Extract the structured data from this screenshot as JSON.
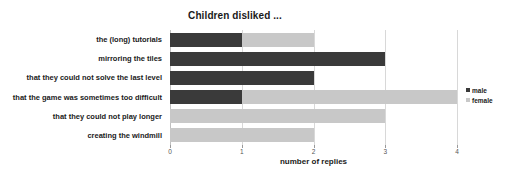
{
  "chart_data": {
    "type": "bar",
    "orientation": "horizontal",
    "stacked": true,
    "title": "Children disliked ...",
    "xlabel": "number of replies",
    "ylabel": "",
    "xlim": [
      0,
      4
    ],
    "xticks": [
      0,
      1,
      2,
      3,
      4
    ],
    "xticklabels": [
      "0",
      "1",
      "2",
      "3",
      "4"
    ],
    "grid": true,
    "legend_position": "right",
    "categories": [
      "the (long) tutorials",
      "mirroring the tiles",
      "that they could not solve the last level",
      "that the game was sometimes too difficult",
      "that they could not play longer",
      "creating the windmill"
    ],
    "series": [
      {
        "name": "male",
        "color": "#3a3a3a",
        "values": [
          1,
          3,
          2,
          1,
          0,
          0
        ]
      },
      {
        "name": "female",
        "color": "#c8c8c8",
        "values": [
          1,
          0,
          0,
          3,
          3,
          2
        ]
      }
    ],
    "totals": [
      2,
      3,
      2,
      4,
      3,
      2
    ]
  },
  "legend": {
    "items": [
      {
        "label": "male"
      },
      {
        "label": "female"
      }
    ]
  },
  "colors": {
    "male": "#3a3a3a",
    "female": "#c8c8c8",
    "grid": "#d8d8d8",
    "background": "#ffffff",
    "text": "#1a1a1a"
  }
}
